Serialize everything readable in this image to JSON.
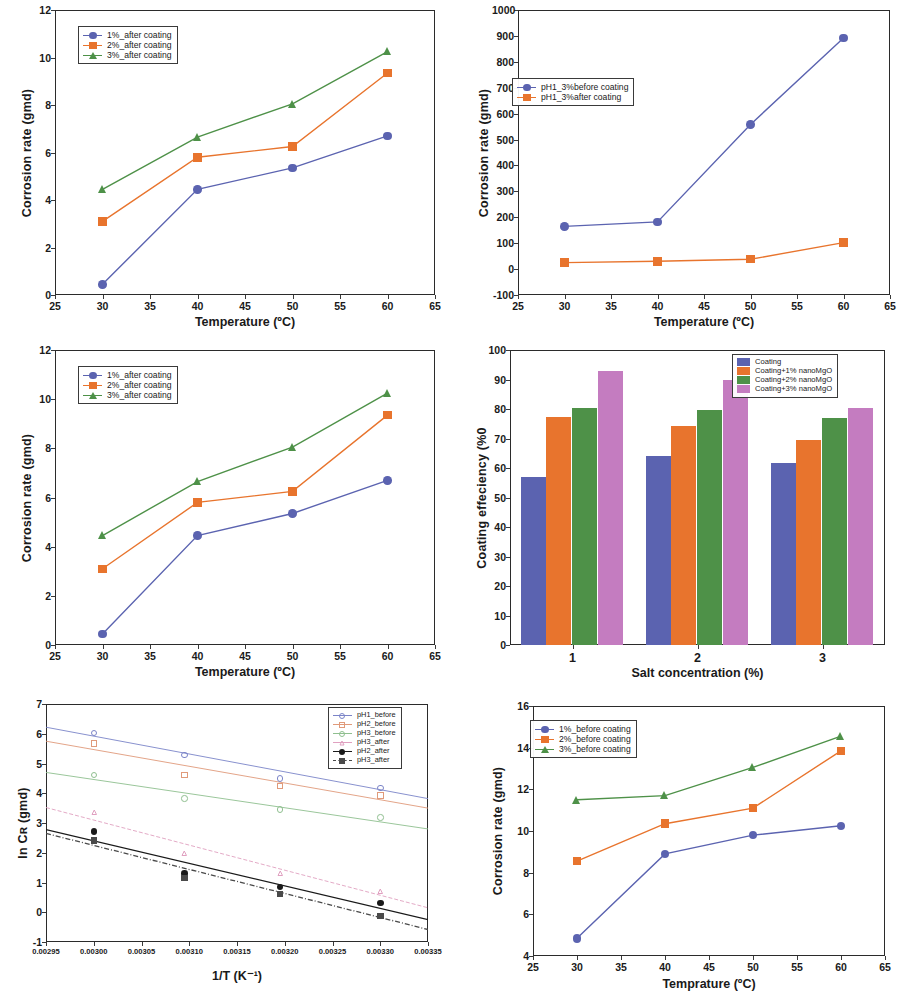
{
  "figure": {
    "title": "",
    "panel_count": 6
  },
  "colors": {
    "blue": "#5b63b0",
    "orange": "#e8742d",
    "green": "#4e9148",
    "magenta": "#c47cc0",
    "black": "#1a1a1a",
    "axis": "#2b2b2b",
    "pink": "#e0a0c0"
  },
  "chart_data": [
    {
      "id": "panel1",
      "type": "line",
      "title": "",
      "xlabel": "Temperature (ºC)",
      "ylabel": "Corrosion rate (gmd)",
      "xlim": [
        25,
        65
      ],
      "ylim": [
        0,
        12
      ],
      "xticks": [
        25,
        30,
        35,
        40,
        45,
        50,
        55,
        60,
        65
      ],
      "yticks": [
        0,
        2,
        4,
        6,
        8,
        10,
        12
      ],
      "grid": false,
      "legend_position": "upper-left",
      "x": [
        30,
        40,
        50,
        60
      ],
      "series": [
        {
          "name": "1%_after  coating",
          "color": "#5b63b0",
          "marker": "circle",
          "values": [
            0.45,
            4.45,
            5.35,
            6.7
          ]
        },
        {
          "name": "2%_after  coating",
          "color": "#e8742d",
          "marker": "square",
          "values": [
            3.1,
            5.8,
            6.25,
            9.35
          ]
        },
        {
          "name": "3%_after coating",
          "color": "#4e9148",
          "marker": "triangle",
          "values": [
            4.45,
            6.65,
            8.05,
            10.25
          ]
        }
      ]
    },
    {
      "id": "panel2",
      "type": "line",
      "title": "",
      "xlabel": "Temperature (ºC)",
      "ylabel": "Corrosion rate (gmd)",
      "xlim": [
        25,
        65
      ],
      "ylim": [
        -100,
        1000
      ],
      "xticks": [
        25,
        30,
        35,
        40,
        45,
        50,
        55,
        60,
        65
      ],
      "yticks": [
        -100,
        0,
        100,
        200,
        300,
        400,
        500,
        600,
        700,
        800,
        900,
        1000
      ],
      "grid": false,
      "legend_position": "mid-left",
      "x": [
        30,
        40,
        50,
        60
      ],
      "series": [
        {
          "name": "pH1_3%before coating",
          "color": "#5b63b0",
          "marker": "circle",
          "values": [
            165,
            182,
            558,
            892
          ]
        },
        {
          "name": "pH1_3%after coating",
          "color": "#e8742d",
          "marker": "square",
          "values": [
            25,
            30,
            38,
            102
          ]
        }
      ]
    },
    {
      "id": "panel3",
      "type": "line",
      "title": "",
      "xlabel": "Temperature (ºC)",
      "ylabel": "Corrosion rate (gmd)",
      "xlim": [
        25,
        65
      ],
      "ylim": [
        0,
        12
      ],
      "xticks": [
        25,
        30,
        35,
        40,
        45,
        50,
        55,
        60,
        65
      ],
      "yticks": [
        0,
        2,
        4,
        6,
        8,
        10,
        12
      ],
      "grid": false,
      "legend_position": "upper-left",
      "x": [
        30,
        40,
        50,
        60
      ],
      "series": [
        {
          "name": "1%_after  coating",
          "color": "#5b63b0",
          "marker": "circle",
          "values": [
            0.45,
            4.45,
            5.35,
            6.7
          ]
        },
        {
          "name": "2%_after  coating",
          "color": "#e8742d",
          "marker": "square",
          "values": [
            3.1,
            5.8,
            6.25,
            9.35
          ]
        },
        {
          "name": "3%_after coating",
          "color": "#4e9148",
          "marker": "triangle",
          "values": [
            4.45,
            6.65,
            8.05,
            10.25
          ]
        }
      ]
    },
    {
      "id": "panel4",
      "type": "bar",
      "title": "",
      "xlabel": "Salt concentration (%)",
      "ylabel": "Coating effeciency (%0",
      "categories": [
        "1",
        "2",
        "3"
      ],
      "ylim": [
        0,
        100
      ],
      "yticks": [
        0,
        10,
        20,
        30,
        40,
        50,
        60,
        70,
        80,
        90,
        100
      ],
      "grid": false,
      "legend_position": "upper-right",
      "series": [
        {
          "name": "Coating",
          "color": "#5b63b0",
          "values": [
            56.8,
            64.2,
            61.7
          ]
        },
        {
          "name": "Coating+1% nanoMgO",
          "color": "#e8742d",
          "values": [
            77.3,
            74.2,
            69.4
          ]
        },
        {
          "name": "Coating+2% nanoMgO",
          "color": "#4e9148",
          "values": [
            80.4,
            79.5,
            77.1
          ]
        },
        {
          "name": "Coating+3% nanoMgO",
          "color": "#c47cc0",
          "values": [
            92.9,
            89.9,
            80.3
          ]
        }
      ]
    },
    {
      "id": "panel5",
      "type": "scatter",
      "title": "",
      "xlabel": "1/T (K⁻¹)",
      "ylabel": "ln Cʀ (gmd)",
      "xlim": [
        0.00295,
        0.00335
      ],
      "ylim": [
        -1,
        7
      ],
      "xticks": [
        "0.00295",
        "0.00300",
        "0.00305",
        "0.00310",
        "0.00315",
        "0.00320",
        "0.00325",
        "0.00330",
        "0.00335"
      ],
      "yticks": [
        -1,
        0,
        1,
        2,
        3,
        4,
        5,
        6,
        7
      ],
      "grid": false,
      "legend_position": "upper-right",
      "x": [
        0.003,
        0.003095,
        0.003195,
        0.0033
      ],
      "series": [
        {
          "name": "pH1_before",
          "color": "#7b84c8",
          "marker": "circle-open",
          "values": [
            6.02,
            5.28,
            4.5,
            4.18
          ],
          "fit": [
            6.22,
            3.82
          ]
        },
        {
          "name": "pH2_before",
          "color": "#e09a7a",
          "marker": "square-open",
          "values": [
            5.68,
            4.62,
            4.24,
            3.92
          ],
          "fit": [
            5.75,
            3.5
          ]
        },
        {
          "name": "pH3_before",
          "color": "#8fbf8f",
          "marker": "circle-open",
          "values": [
            4.62,
            3.82,
            3.45,
            3.18
          ],
          "fit": [
            4.7,
            2.8
          ]
        },
        {
          "name": "pH3_after",
          "color": "#e0a0c0",
          "marker": "triangle-open",
          "values": [
            3.35,
            1.98,
            1.3,
            0.7
          ],
          "fit": [
            3.52,
            0.15
          ]
        },
        {
          "name": "pH2_after",
          "color": "#1a1a1a",
          "marker": "circle-filled",
          "values": [
            2.72,
            1.3,
            0.85,
            0.32
          ],
          "fit": [
            2.78,
            -0.25
          ]
        },
        {
          "name": "pH3_after",
          "color": "#4a4a4a",
          "marker": "square-filled",
          "values": [
            2.42,
            1.15,
            0.62,
            -0.12
          ],
          "fit": [
            2.65,
            -0.58
          ]
        }
      ]
    },
    {
      "id": "panel6",
      "type": "line",
      "title": "",
      "xlabel": "Temprature (ºC)",
      "ylabel": "Corrosion rate (gmd)",
      "xlim": [
        25,
        65
      ],
      "ylim": [
        4,
        16
      ],
      "xticks": [
        25,
        30,
        35,
        40,
        45,
        50,
        55,
        60,
        65
      ],
      "yticks": [
        4,
        6,
        8,
        10,
        12,
        14,
        16
      ],
      "grid": false,
      "legend_position": "upper-left",
      "x": [
        30,
        40,
        50,
        60
      ],
      "series": [
        {
          "name": "1%_before coating",
          "color": "#5b63b0",
          "marker": "circle",
          "values": [
            4.85,
            8.9,
            9.8,
            10.25
          ]
        },
        {
          "name": "2%_before coating",
          "color": "#e8742d",
          "marker": "square",
          "values": [
            8.55,
            10.35,
            11.1,
            13.85
          ]
        },
        {
          "name": "3%_before coating",
          "color": "#4e9148",
          "marker": "triangle",
          "values": [
            11.5,
            11.7,
            13.05,
            14.55
          ]
        }
      ]
    }
  ]
}
